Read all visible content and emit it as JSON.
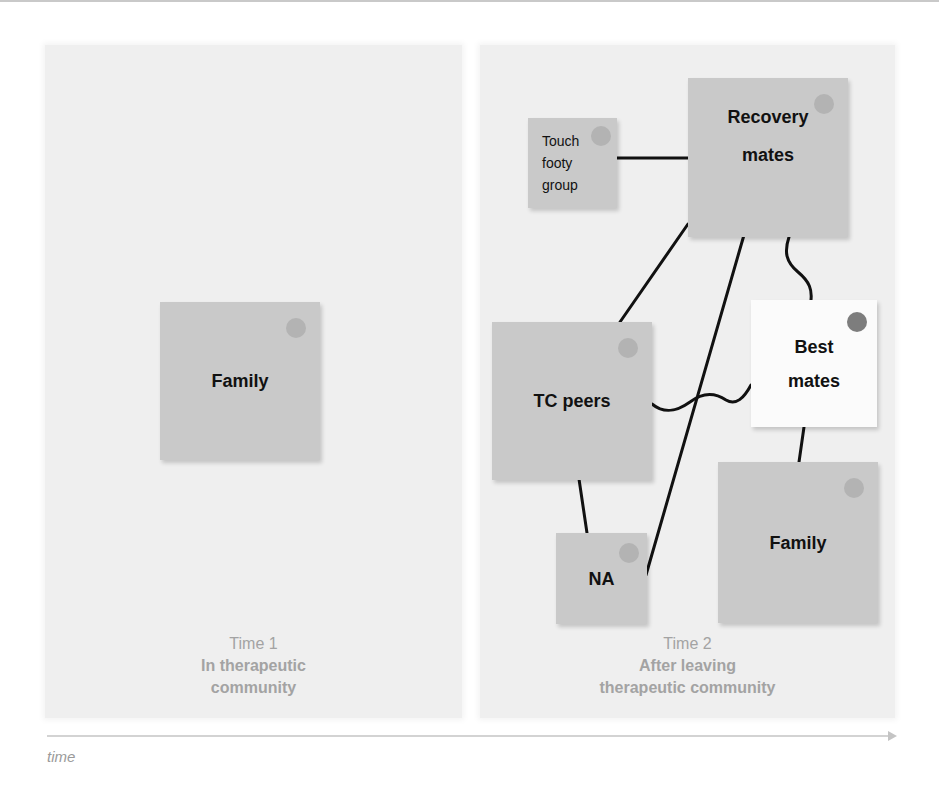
{
  "colors": {
    "panel_bg": "#efefef",
    "note_gray": "#c9c9c9",
    "note_white": "#fbfbfb",
    "pin_light": "#b3b3b3",
    "pin_dark": "#7d7d7d",
    "caption": "#a3a3a3",
    "line": "#111111"
  },
  "panels": [
    {
      "caption_time": "Time 1",
      "caption_stage": "In therapeutic\ncommunity",
      "notes": [
        {
          "label": "Family",
          "style": "gray"
        }
      ]
    },
    {
      "caption_time": "Time 2",
      "caption_stage": "After leaving\ntherapeutic community",
      "notes": [
        {
          "label": "Touch\nfooty\ngroup",
          "style": "gray-small"
        },
        {
          "label": "Recovery\nmates",
          "style": "gray"
        },
        {
          "label": "TC peers",
          "style": "gray"
        },
        {
          "label": "Best\nmates",
          "style": "white"
        },
        {
          "label": "NA",
          "style": "gray"
        },
        {
          "label": "Family",
          "style": "gray"
        }
      ],
      "links": [
        {
          "from": "Touch footy group",
          "to": "Recovery mates",
          "type": "straight"
        },
        {
          "from": "Recovery mates",
          "to": "TC peers",
          "type": "straight"
        },
        {
          "from": "Recovery mates",
          "to": "NA",
          "type": "straight"
        },
        {
          "from": "Recovery mates",
          "to": "Best mates",
          "type": "wavy"
        },
        {
          "from": "TC peers",
          "to": "Best mates",
          "type": "wavy"
        },
        {
          "from": "TC peers",
          "to": "NA",
          "type": "straight"
        },
        {
          "from": "Best mates",
          "to": "Family",
          "type": "straight"
        }
      ]
    }
  ],
  "axis": {
    "label": "time"
  }
}
